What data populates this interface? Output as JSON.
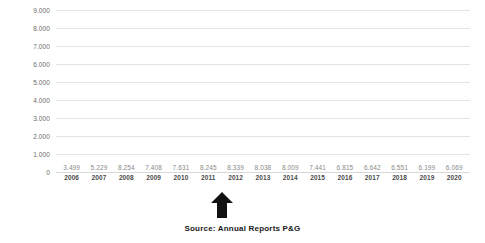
{
  "chart_data": {
    "type": "bar",
    "title": "",
    "subtitle": "",
    "xlabel": "",
    "ylabel": "",
    "categories": [
      "2006",
      "2007",
      "2008",
      "2009",
      "2010",
      "2011",
      "2012",
      "2013",
      "2014",
      "2015",
      "2016",
      "2017",
      "2018",
      "2019",
      "2020"
    ],
    "values": [
      3499,
      5229,
      8254,
      7408,
      7631,
      8245,
      8339,
      8038,
      8009,
      7441,
      6815,
      6642,
      6551,
      6199,
      6069
    ],
    "value_labels": [
      "3.499",
      "5.229",
      "8.254",
      "7.408",
      "7.631",
      "8.245",
      "8.339",
      "8.038",
      "8.009",
      "7.441",
      "6.815",
      "6.642",
      "6.551",
      "6.199",
      "6.069"
    ],
    "ylim": [
      0,
      9000
    ],
    "ytick_labels": [
      "9.000",
      "8.000",
      "7.000",
      "6.000",
      "5.000",
      "4.000",
      "3.000",
      "2.000",
      "1.000",
      "0"
    ],
    "ytick_values": [
      9000,
      8000,
      7000,
      6000,
      5000,
      4000,
      3000,
      2000,
      1000,
      0
    ],
    "grid": true,
    "legend": false,
    "legend_position": "none",
    "bar_color": "#b3b3b3",
    "gridline_color": "#e4e4e4",
    "value_label_color": "#8a8a8a",
    "axis_label_color": "#4a4a4a",
    "annotations": [
      {
        "name": "up-arrow",
        "points_to_category": "2012",
        "color": "#111111",
        "shape": "arrow-up"
      }
    ]
  },
  "caption": {
    "source_text": "Source: Annual Reports P&G"
  }
}
